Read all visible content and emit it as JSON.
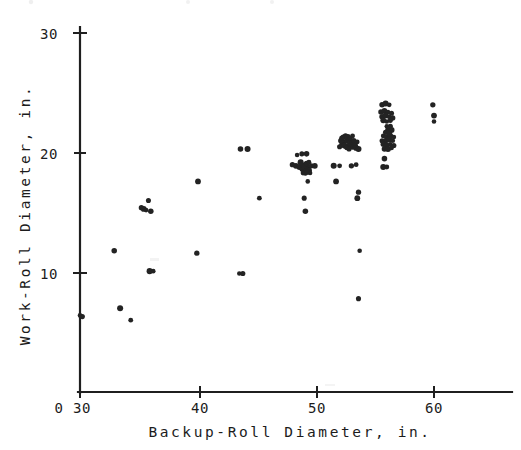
{
  "figure": {
    "title": "",
    "background_color": "#ffffff",
    "ink_color": "#1f1f1f",
    "point_color": "#232323"
  },
  "axes": {
    "x": {
      "label": "Backup-Roll Diameter, in.",
      "origin_label": "0",
      "ticks": [
        30,
        40,
        50,
        60
      ],
      "tick_labels": [
        "30",
        "40",
        "50",
        "60"
      ],
      "range": [
        30,
        64
      ]
    },
    "y": {
      "label": "Work-Roll Diameter, in.",
      "origin_label": "0",
      "ticks": [
        10,
        20,
        30
      ],
      "tick_labels": [
        "10",
        "20",
        "30"
      ],
      "range": [
        0,
        30
      ]
    }
  },
  "chart_data": {
    "type": "scatter",
    "title": "",
    "xlabel": "Backup-Roll Diameter, in.",
    "ylabel": "Work-Roll Diameter, in.",
    "xlim": [
      30,
      64
    ],
    "ylim": [
      0,
      30
    ],
    "xticks": [
      30,
      40,
      50,
      60
    ],
    "yticks": [
      10,
      20,
      30
    ],
    "grid": false,
    "legend": false,
    "marker": "filled-circle",
    "n_points": 168,
    "points": [
      [
        30.0,
        6.4
      ],
      [
        30.2,
        6.3
      ],
      [
        32.9,
        11.8
      ],
      [
        33.4,
        7.0
      ],
      [
        34.3,
        6.0
      ],
      [
        35.2,
        15.4
      ],
      [
        35.4,
        15.3
      ],
      [
        35.6,
        15.2
      ],
      [
        35.8,
        16.0
      ],
      [
        36.0,
        15.1
      ],
      [
        35.9,
        10.1
      ],
      [
        36.2,
        10.1
      ],
      [
        39.9,
        11.6
      ],
      [
        40.0,
        17.6
      ],
      [
        43.5,
        9.9
      ],
      [
        43.8,
        9.9
      ],
      [
        43.6,
        20.3
      ],
      [
        44.2,
        20.3
      ],
      [
        45.2,
        16.2
      ],
      [
        48.0,
        19.0
      ],
      [
        48.3,
        18.9
      ],
      [
        48.4,
        19.8
      ],
      [
        48.8,
        19.9
      ],
      [
        49.2,
        19.9
      ],
      [
        48.6,
        18.8
      ],
      [
        48.9,
        18.9
      ],
      [
        49.1,
        19.0
      ],
      [
        49.3,
        18.8
      ],
      [
        48.8,
        18.6
      ],
      [
        49.0,
        18.5
      ],
      [
        49.2,
        18.6
      ],
      [
        49.4,
        18.5
      ],
      [
        48.9,
        18.3
      ],
      [
        49.1,
        18.3
      ],
      [
        49.3,
        18.4
      ],
      [
        49.5,
        18.3
      ],
      [
        49.0,
        18.9
      ],
      [
        49.2,
        19.1
      ],
      [
        48.7,
        19.2
      ],
      [
        49.4,
        19.2
      ],
      [
        49.6,
        18.9
      ],
      [
        49.9,
        18.9
      ],
      [
        49.3,
        17.6
      ],
      [
        49.0,
        16.2
      ],
      [
        49.1,
        15.1
      ],
      [
        51.5,
        18.9
      ],
      [
        52.0,
        18.9
      ],
      [
        53.0,
        18.9
      ],
      [
        51.7,
        17.6
      ],
      [
        52.5,
        20.5
      ],
      [
        52.7,
        20.6
      ],
      [
        52.9,
        20.7
      ],
      [
        53.1,
        20.5
      ],
      [
        52.4,
        20.9
      ],
      [
        52.6,
        21.0
      ],
      [
        52.8,
        21.1
      ],
      [
        53.0,
        20.9
      ],
      [
        52.3,
        21.3
      ],
      [
        52.5,
        21.4
      ],
      [
        52.7,
        21.3
      ],
      [
        52.9,
        21.2
      ],
      [
        52.2,
        20.7
      ],
      [
        52.4,
        20.6
      ],
      [
        52.6,
        20.4
      ],
      [
        52.8,
        20.3
      ],
      [
        53.2,
        21.0
      ],
      [
        53.3,
        20.6
      ],
      [
        53.1,
        21.4
      ],
      [
        52.1,
        21.0
      ],
      [
        53.4,
        20.4
      ],
      [
        53.5,
        20.9
      ],
      [
        52.0,
        20.5
      ],
      [
        52.2,
        21.2
      ],
      [
        53.6,
        20.3
      ],
      [
        53.4,
        19.0
      ],
      [
        53.6,
        16.7
      ],
      [
        53.5,
        16.2
      ],
      [
        53.7,
        11.8
      ],
      [
        53.6,
        7.8
      ],
      [
        55.6,
        24.0
      ],
      [
        55.9,
        24.1
      ],
      [
        56.2,
        24.0
      ],
      [
        55.5,
        23.4
      ],
      [
        55.8,
        23.5
      ],
      [
        56.1,
        23.4
      ],
      [
        56.4,
        23.3
      ],
      [
        55.6,
        23.0
      ],
      [
        55.9,
        23.1
      ],
      [
        56.2,
        23.0
      ],
      [
        56.5,
        22.9
      ],
      [
        55.7,
        22.7
      ],
      [
        56.0,
        22.6
      ],
      [
        56.3,
        22.7
      ],
      [
        56.1,
        21.9
      ],
      [
        56.4,
        21.9
      ],
      [
        55.7,
        21.4
      ],
      [
        56.0,
        21.3
      ],
      [
        56.3,
        21.4
      ],
      [
        56.6,
        21.3
      ],
      [
        55.6,
        21.0
      ],
      [
        55.9,
        21.0
      ],
      [
        56.2,
        21.1
      ],
      [
        56.5,
        21.0
      ],
      [
        55.7,
        20.7
      ],
      [
        56.0,
        20.6
      ],
      [
        56.3,
        20.7
      ],
      [
        56.6,
        20.6
      ],
      [
        55.8,
        20.3
      ],
      [
        56.1,
        20.3
      ],
      [
        56.4,
        20.4
      ],
      [
        55.9,
        21.7
      ],
      [
        56.2,
        21.6
      ],
      [
        56.0,
        22.2
      ],
      [
        56.3,
        22.2
      ],
      [
        55.8,
        19.5
      ],
      [
        55.7,
        18.8
      ],
      [
        56.0,
        18.8
      ],
      [
        59.9,
        24.0
      ],
      [
        60.0,
        23.1
      ],
      [
        60.0,
        22.6
      ]
    ],
    "clusters": [
      {
        "center_x": 49.0,
        "center_y": 18.8,
        "count": 24,
        "note": "dense cluster near 49 in backup / 19 in work"
      },
      {
        "center_x": 52.7,
        "center_y": 20.8,
        "count": 25,
        "note": "dense cluster near 53 in backup / 21 in work"
      },
      {
        "center_x": 56.0,
        "center_y": 21.8,
        "count": 34,
        "note": "dense elongated cluster near 56 in backup, 19-24 in work"
      }
    ]
  }
}
